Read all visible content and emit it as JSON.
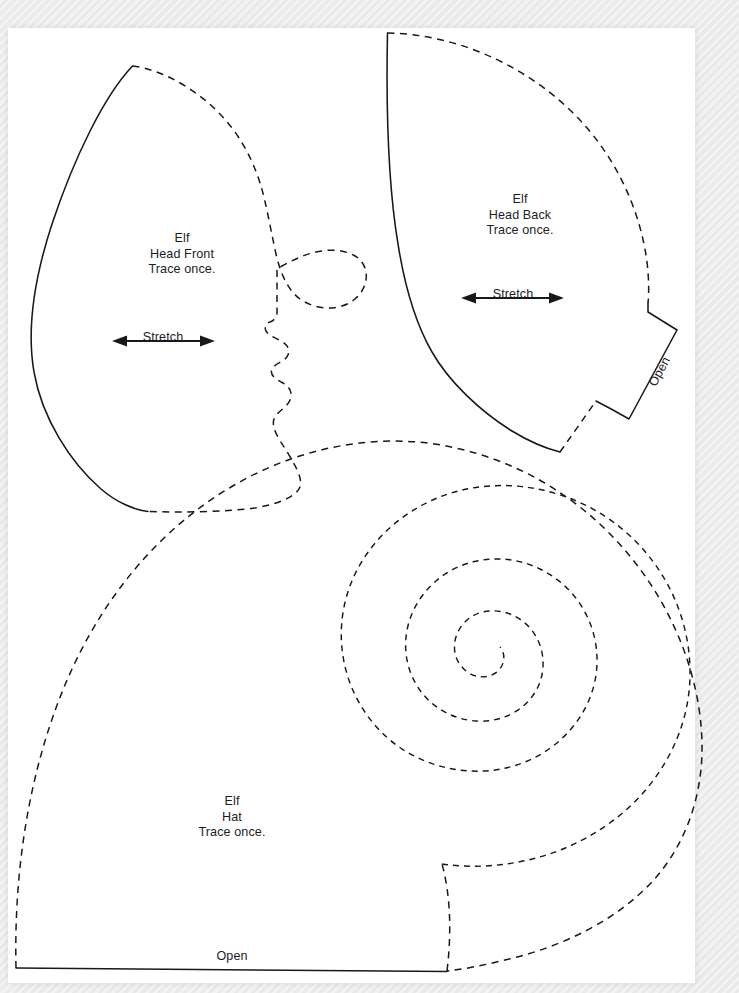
{
  "document": {
    "kind": "sewing-pattern-sheet",
    "title": "Elf Pattern Pieces",
    "page_background": "#ececec",
    "sheet_color": "#ffffff",
    "ink_color": "#16181a"
  },
  "pieces": [
    {
      "id": "head-front",
      "label": "Elf\nHead Front\nTrace once.",
      "name_line": "Elf",
      "part_line": "Head Front",
      "instruction_line": "Trace once.",
      "grain_label": "Stretch",
      "label_x": 182,
      "label_y": 231,
      "stretch_arrow": {
        "x1": 112,
        "x2": 215,
        "y": 341,
        "label_x": 163,
        "label_y": 330
      }
    },
    {
      "id": "head-back",
      "label": "Elf\nHead Back\nTrace once.",
      "name_line": "Elf",
      "part_line": "Head Back",
      "instruction_line": "Trace once.",
      "grain_label": "Stretch",
      "open_label": "Open",
      "label_x": 520,
      "label_y": 192,
      "stretch_arrow": {
        "x1": 461,
        "x2": 564,
        "y": 298,
        "label_x": 513,
        "label_y": 287
      },
      "open_text": {
        "x": 646,
        "y": 382,
        "rotation_deg": -62
      }
    },
    {
      "id": "hat",
      "label": "Elf\nHat\nTrace once.",
      "name_line": "Elf",
      "part_line": "Hat",
      "instruction_line": "Trace once.",
      "open_label": "Open",
      "label_x": 232,
      "label_y": 794,
      "open_text": {
        "x": 232,
        "y": 949
      }
    }
  ],
  "legend": {
    "dashed_meaning": "cut line / seam edge",
    "solid_meaning": "placement or fold edge",
    "stretch_meaning": "direction of greatest stretch",
    "open_meaning": "leave this edge open"
  }
}
